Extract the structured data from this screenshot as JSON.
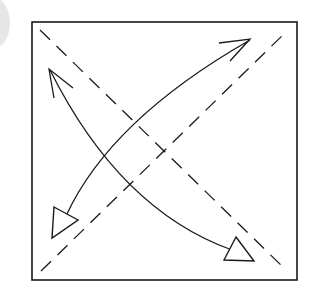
{
  "diagram": {
    "type": "origami-fold-instruction",
    "colors": {
      "line": "#1a1a1a",
      "background": "#ffffff",
      "badge": "#e6e6e6"
    },
    "square": {
      "x": 32,
      "y": 22,
      "width": 265,
      "height": 258
    },
    "fold_lines": [
      {
        "name": "diagonal-tl-br",
        "style": "dashed"
      },
      {
        "name": "diagonal-bl-tr",
        "style": "dashed"
      }
    ],
    "arrows": [
      {
        "name": "arrow-bl-tr",
        "head_open_end": "top-right",
        "head_hollow_end": "bottom-left"
      },
      {
        "name": "arrow-tl-br",
        "head_open_end": "top-left",
        "head_hollow_end": "bottom-right"
      }
    ]
  }
}
